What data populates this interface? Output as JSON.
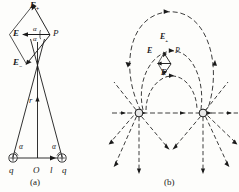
{
  "figure": {
    "background_color": "#fdfdfb",
    "ink_color": "#1a1a1a",
    "width": 239,
    "height": 192,
    "panels": [
      {
        "id": "a",
        "caption": "(a)",
        "description": "Vector superposition diagram at field point P",
        "labels": {
          "e_plus": "E",
          "e_plus_sub": "+",
          "e_minus": "E",
          "e_minus_sub": "−",
          "e_resultant": "E",
          "point_p": "P",
          "distance_r": "r",
          "origin": "O",
          "separation": "l",
          "charge_left": "q",
          "charge_right": "q",
          "angle_left": "α",
          "angle_right": "α",
          "angle_upper": "α",
          "angle_lower": "α"
        }
      },
      {
        "id": "b",
        "caption": "(b)",
        "description": "Electric field line map for two like positive charges",
        "labels": {
          "e_plus": "E",
          "e_plus_sub": "+",
          "e_minus": "E",
          "e_minus_sub": "−",
          "e_resultant": "E",
          "point_p": "P"
        }
      }
    ]
  }
}
